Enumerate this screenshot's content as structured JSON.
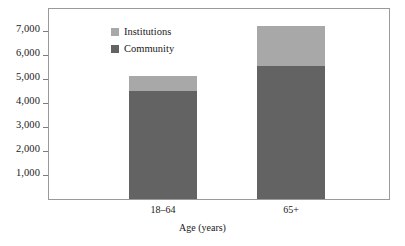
{
  "chart_data": {
    "type": "bar",
    "subtype": "stacked-bar",
    "title": "",
    "xlabel": "Age (years)",
    "ylabel": "",
    "categories": [
      "18–64",
      "65+"
    ],
    "series": [
      {
        "name": "Community",
        "color": "#636363",
        "values": [
          4500,
          5550
        ]
      },
      {
        "name": "Institutions",
        "color": "#a8a8a8",
        "values": [
          600,
          1650
        ]
      }
    ],
    "totals": [
      5100,
      7200
    ],
    "ylim": [
      0,
      7900
    ],
    "yticks": [
      1000,
      2000,
      3000,
      4000,
      5000,
      6000,
      7000
    ],
    "ytick_labels": [
      "1,000",
      "2,000",
      "3,000",
      "4,000",
      "5,000",
      "6,000",
      "7,000"
    ],
    "grid": false,
    "legend_position": "top-left-inside",
    "legend_entries": [
      "Institutions",
      "Community"
    ],
    "stack_order_bottom_to_top": [
      "Community",
      "Institutions"
    ]
  },
  "axes": {
    "y": {
      "ticks": [
        {
          "label": "7,000",
          "value": 7000
        },
        {
          "label": "6,000",
          "value": 6000
        },
        {
          "label": "5,000",
          "value": 5000
        },
        {
          "label": "4,000",
          "value": 4000
        },
        {
          "label": "3,000",
          "value": 3000
        },
        {
          "label": "2,000",
          "value": 2000
        },
        {
          "label": "1,000",
          "value": 1000
        }
      ]
    },
    "x": {
      "title": "Age (years)",
      "ticks": [
        {
          "label": "18–64"
        },
        {
          "label": "65+"
        }
      ]
    }
  },
  "legend": {
    "items": [
      {
        "label": "Institutions",
        "color": "#a8a8a8"
      },
      {
        "label": "Community",
        "color": "#636363"
      }
    ]
  },
  "colors": {
    "institutions": "#a8a8a8",
    "community": "#636363",
    "frame": "#9a9a9a",
    "tick": "#7d7d7d",
    "text": "#1a1a1a",
    "background": "#ffffff"
  }
}
